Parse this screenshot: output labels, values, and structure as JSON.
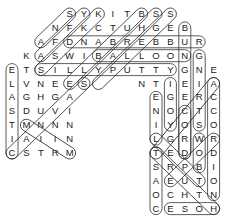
{
  "puzzle": {
    "type": "word-search",
    "grid_origin": {
      "x": 12,
      "y": 14
    },
    "cell_spacing": {
      "x": 14.4,
      "y": 13.9
    },
    "rows": [
      {
        "row": 0,
        "start_col": 4,
        "letters": "SYKITBSS"
      },
      {
        "row": 1,
        "start_col": 3,
        "letters": "NFKCTUHGEB"
      },
      {
        "row": 2,
        "start_col": 2,
        "letters": "AFDNABREBBUR"
      },
      {
        "row": 3,
        "start_col": 1,
        "letters": "KASWIBALLOONG"
      },
      {
        "row": 4,
        "start_col": 0,
        "letters": "ETSILLYPUTTYGNE"
      },
      {
        "row": 5,
        "start_col": 0,
        "letters": "LVNEES"
      },
      {
        "row": 5,
        "start_col": 9,
        "letters": "NTIEIA"
      },
      {
        "row": 6,
        "start_col": 0,
        "letters": "AGHGA"
      },
      {
        "row": 6,
        "start_col": 10,
        "letters": "EGERC"
      },
      {
        "row": 7,
        "start_col": 0,
        "letters": "SDUVI"
      },
      {
        "row": 7,
        "start_col": 10,
        "letters": "NOCTC"
      },
      {
        "row": 8,
        "start_col": 0,
        "letters": "TMNNN"
      },
      {
        "row": 8,
        "start_col": 10,
        "letters": "IYOSO"
      },
      {
        "row": 9,
        "start_col": 0,
        "letters": "IAIIN"
      },
      {
        "row": 9,
        "start_col": 10,
        "letters": "LGRWR"
      },
      {
        "row": 10,
        "start_col": 0,
        "letters": "CSTRM"
      },
      {
        "row": 10,
        "start_col": 10,
        "letters": "TEDOD"
      },
      {
        "row": 11,
        "start_col": 10,
        "letters": "SRPBI"
      },
      {
        "row": 12,
        "start_col": 10,
        "letters": "AEUTO"
      },
      {
        "row": 13,
        "start_col": 10,
        "letters": "OCHTN"
      },
      {
        "row": 14,
        "start_col": 10,
        "letters": "CESOH"
      }
    ],
    "found_words": [
      {
        "word": "RUBBER BAND",
        "from": [
          2,
          13
        ],
        "to": [
          2,
          4
        ]
      },
      {
        "word": "BALLOON",
        "from": [
          3,
          6
        ],
        "to": [
          3,
          12
        ]
      },
      {
        "word": "SILLY PUTTY",
        "from": [
          4,
          2
        ],
        "to": [
          4,
          11
        ]
      },
      {
        "word": "ELASTIC",
        "from": [
          4,
          0
        ],
        "to": [
          10,
          0
        ]
      },
      {
        "word": "BUNGEE CORD",
        "from": [
          1,
          12
        ],
        "to": [
          10,
          12
        ]
      },
      {
        "word": "STRING",
        "from": [
          8,
          13
        ],
        "to": [
          3,
          13
        ]
      },
      {
        "word": "ACCORDION",
        "from": [
          5,
          14
        ],
        "to": [
          13,
          14
        ]
      },
      {
        "word": "LINE",
        "from": [
          9,
          10
        ],
        "to": [
          6,
          10
        ]
      },
      {
        "word": "YOGI",
        "from": [
          8,
          11
        ],
        "to": [
          5,
          11
        ]
      },
      {
        "word": "COAST",
        "from": [
          14,
          10
        ],
        "to": [
          10,
          10
        ]
      },
      {
        "word": "HOSE",
        "from": [
          14,
          14
        ],
        "to": [
          14,
          11
        ]
      },
      {
        "word": "BOW",
        "from": [
          11,
          13
        ],
        "to": [
          9,
          13
        ]
      },
      {
        "word": "SKY",
        "from": [
          0,
          4
        ],
        "to": [
          2,
          2
        ]
      },
      {
        "word": "YKFA",
        "from": [
          0,
          5
        ],
        "to": [
          3,
          2
        ]
      },
      {
        "word": "KNOT",
        "from": [
          0,
          6
        ],
        "to": [
          4,
          2
        ]
      },
      {
        "word": "BUNGEE",
        "from": [
          0,
          9
        ],
        "to": [
          5,
          4
        ]
      },
      {
        "word": "SHELLS",
        "from": [
          0,
          10
        ],
        "to": [
          5,
          5
        ]
      },
      {
        "word": "SGBLIE",
        "from": [
          0,
          11
        ],
        "to": [
          5,
          6
        ]
      },
      {
        "word": "SPANDEX",
        "from": [
          5,
          5
        ],
        "to": [
          10,
          0
        ]
      },
      {
        "word": "MINI",
        "from": [
          8,
          1
        ],
        "to": [
          10,
          4
        ]
      },
      {
        "word": "LOOP",
        "from": [
          9,
          10
        ],
        "to": [
          12,
          13
        ]
      },
      {
        "word": "THREAD",
        "from": [
          10,
          10
        ],
        "to": [
          14,
          14
        ]
      },
      {
        "word": "ROPE",
        "from": [
          9,
          14
        ],
        "to": [
          12,
          11
        ]
      },
      {
        "word": "SPRING",
        "from": [
          5,
          14
        ],
        "to": [
          10,
          10
        ]
      },
      {
        "word": "CORD",
        "from": [
          7,
          12
        ],
        "to": [
          10,
          12
        ]
      }
    ]
  }
}
